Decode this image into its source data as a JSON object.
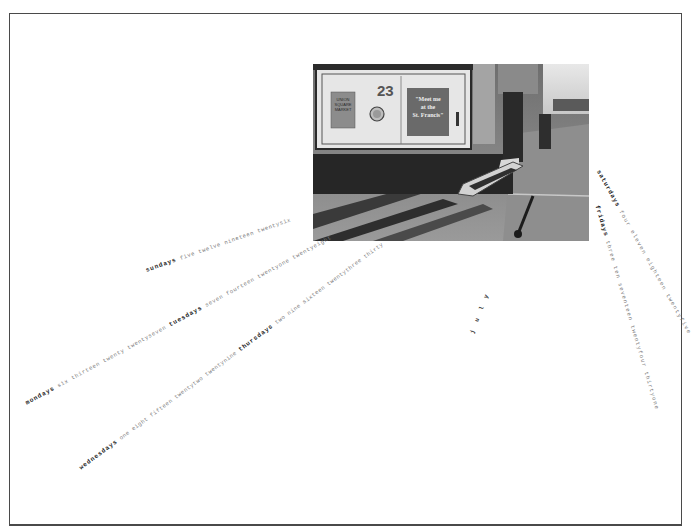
{
  "photo": {
    "caption_car_number": "23",
    "sign_text": "\"Meet me at the St. Francis\"",
    "sign_lines": [
      "\"Meet me",
      "at the",
      "St. Francis\""
    ],
    "small_sign_lines": [
      "UNION",
      "SQUARE",
      "MARKET"
    ]
  },
  "calendar": {
    "month": "july",
    "lines": [
      {
        "segments": [
          {
            "day": "sundays",
            "numbers": "five twelve nineteen twentysix"
          }
        ]
      },
      {
        "segments": [
          {
            "day": "mondays",
            "numbers": "six thirteen twenty twentyseven"
          },
          {
            "day": "tuesdays",
            "numbers": "seven fourteen twentyone twentyeight"
          }
        ]
      },
      {
        "segments": [
          {
            "day": "wednesdays",
            "numbers": "one eight fifteen twentytwo twentynine"
          },
          {
            "day": "thursdays",
            "numbers": "two nine sixteen twentythree thirty"
          }
        ]
      },
      {
        "segments": [
          {
            "day": "saturdays",
            "numbers": "four eleven eighteen twentyfive"
          }
        ]
      },
      {
        "segments": [
          {
            "day": "fridays",
            "numbers": "three ten seventeen twentyfour thirtyone"
          }
        ]
      }
    ]
  },
  "colors": {
    "border": "#4a4a4a",
    "day_text": "#1e1e1e",
    "number_text": "#7a7a7a"
  }
}
